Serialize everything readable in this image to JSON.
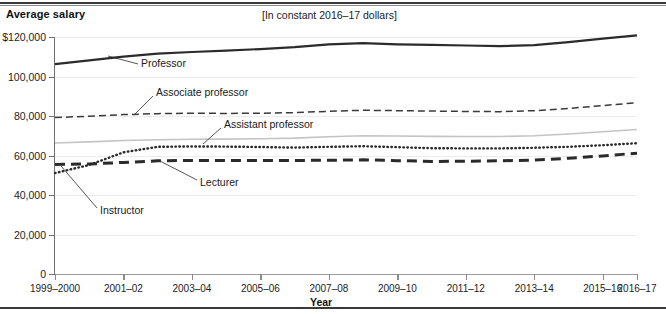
{
  "header": {
    "y_axis_title": "Average salary",
    "subtitle": "[In constant 2016–17 dollars]"
  },
  "footer": {
    "x_axis_title": "Year"
  },
  "chart_data": {
    "type": "line",
    "title": "Average salary",
    "subtitle": "[In constant 2016–17 dollars]",
    "xlabel": "Year",
    "ylabel": "Average salary",
    "ylim": [
      0,
      120000
    ],
    "yticks": [
      0,
      20000,
      40000,
      60000,
      80000,
      100000,
      120000
    ],
    "ytick_labels": [
      "0",
      "20,000",
      "40,000",
      "60,000",
      "80,000",
      "100,000",
      "$120,000"
    ],
    "grid": true,
    "legend": "inline-annotations",
    "categories": [
      "1999-2000",
      "2000-01",
      "2001-02",
      "2002-03",
      "2003-04",
      "2004-05",
      "2005-06",
      "2006-07",
      "2007-08",
      "2008-09",
      "2009-10",
      "2010-11",
      "2011-12",
      "2012-13",
      "2013-14",
      "2014-15",
      "2015-16",
      "2016-17"
    ],
    "xtick_labels": [
      "1999–2000",
      "2001–02",
      "2003–04",
      "2005–06",
      "2007–08",
      "2009–10",
      "2011–12",
      "2013–14",
      "2015–16",
      "2016–17"
    ],
    "series": [
      {
        "name": "Professor",
        "style": "solid-heavy",
        "color": "#2b2b2b",
        "values": [
          106300,
          108200,
          110100,
          111600,
          112400,
          113100,
          113900,
          114900,
          116300,
          116900,
          116300,
          116000,
          115700,
          115400,
          115900,
          117400,
          119200,
          120800
        ]
      },
      {
        "name": "Associate professor",
        "style": "dashed",
        "color": "#3a3a3a",
        "values": [
          79200,
          79900,
          80700,
          81200,
          81400,
          81300,
          81400,
          81700,
          82400,
          82900,
          82700,
          82500,
          82300,
          82200,
          82700,
          83800,
          85300,
          86700
        ]
      },
      {
        "name": "Assistant professor",
        "style": "solid-light",
        "color": "#c4c4c4",
        "values": [
          66300,
          66900,
          67600,
          68000,
          68200,
          68300,
          68500,
          68800,
          69500,
          70000,
          69900,
          69700,
          69600,
          69600,
          70000,
          70900,
          72000,
          73200
        ]
      },
      {
        "name": "Instructor",
        "style": "dotted",
        "color": "#2b2b2b",
        "values": [
          51100,
          55200,
          61600,
          64400,
          64600,
          64500,
          64300,
          64000,
          64400,
          64700,
          64200,
          63700,
          63600,
          63600,
          63900,
          64400,
          65200,
          66200
        ]
      },
      {
        "name": "Lecturer",
        "style": "dashed-heavy",
        "color": "#2b2b2b",
        "values": [
          55500,
          55700,
          56500,
          57300,
          57500,
          57500,
          57500,
          57500,
          57600,
          57800,
          57400,
          57000,
          57100,
          57300,
          57700,
          58600,
          59800,
          61200
        ]
      }
    ],
    "annotations": [
      {
        "text": "Professor",
        "x": 141,
        "y": 64,
        "leader": [
          138,
          64,
          108,
          56
        ]
      },
      {
        "text": "Associate professor",
        "x": 156,
        "y": 93,
        "leader": [
          153,
          96,
          134,
          115
        ]
      },
      {
        "text": "Assistant professor",
        "x": 224,
        "y": 125,
        "leader": [
          221,
          128,
          203,
          144
        ]
      },
      {
        "text": "Lecturer",
        "x": 200,
        "y": 183,
        "leader": [
          197,
          180,
          158,
          160
        ]
      },
      {
        "text": "Instructor",
        "x": 100,
        "y": 211,
        "leader": [
          97,
          208,
          61,
          166
        ]
      }
    ]
  }
}
